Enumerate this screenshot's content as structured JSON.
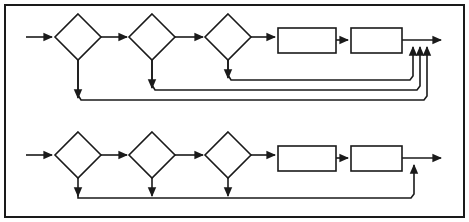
{
  "figure": {
    "type": "flowchart-diagram",
    "title": "",
    "width": 469,
    "height": 222,
    "background_color": "#ffffff",
    "stroke_color": "#1a1a1a",
    "fill_color": "#ffffff",
    "stroke_width": 1.6,
    "border": {
      "present": true,
      "x": 5,
      "y": 5,
      "width": 459,
      "height": 212,
      "stroke_width": 2
    }
  },
  "rows": [
    {
      "id": "top-row",
      "label": "",
      "baseline_y": 37,
      "input_arrow": {
        "x1": 26,
        "y1": 37,
        "x2": 54,
        "y2": 37
      },
      "diamonds": [
        {
          "id": "top-decision-1",
          "label": "",
          "cx": 78,
          "cy": 37,
          "rx": 23,
          "ry": 23
        },
        {
          "id": "top-decision-2",
          "label": "",
          "cx": 152,
          "cy": 37,
          "rx": 23,
          "ry": 23
        },
        {
          "id": "top-decision-3",
          "label": "",
          "cx": 228,
          "cy": 37,
          "rx": 23,
          "ry": 23
        }
      ],
      "rectangles": [
        {
          "id": "top-process-1",
          "label": "",
          "x": 278,
          "y": 28,
          "width": 58,
          "height": 25
        },
        {
          "id": "top-process-2",
          "label": "",
          "x": 351,
          "y": 28,
          "width": 51,
          "height": 25
        }
      ],
      "connectors": [
        {
          "id": "top-conn-d1-d2",
          "x1": 101,
          "y1": 37,
          "x2": 128,
          "y2": 37
        },
        {
          "id": "top-conn-d2-d3",
          "x1": 175,
          "y1": 37,
          "x2": 204,
          "y2": 37
        },
        {
          "id": "top-conn-d3-r1",
          "x1": 251,
          "y1": 37,
          "x2": 276,
          "y2": 37
        },
        {
          "id": "top-conn-r1-r2",
          "x1": 336,
          "y1": 40,
          "x2": 349,
          "y2": 40
        }
      ],
      "output_line": {
        "x1": 402,
        "y1": 40,
        "x2": 442,
        "y2": 40
      },
      "merge_arrows_up": [
        {
          "id": "top-merge-1",
          "x": 413,
          "y_from": 80,
          "y_to": 43
        },
        {
          "id": "top-merge-2",
          "x": 420,
          "y_from": 90,
          "y_to": 43
        },
        {
          "id": "top-merge-3",
          "x": 427,
          "y_from": 100,
          "y_to": 43
        }
      ],
      "return_paths": [
        {
          "id": "top-return-from-d3",
          "from": "top-decision-3",
          "drop_x": 228,
          "drop_y_start": 60,
          "drop_y_end": 77,
          "run_y": 80,
          "run_x_end": 413
        },
        {
          "id": "top-return-from-d2",
          "from": "top-decision-2",
          "drop_x": 152,
          "drop_y_start": 60,
          "drop_y_end": 87,
          "run_y": 90,
          "run_x_end": 420
        },
        {
          "id": "top-return-from-d1",
          "from": "top-decision-1",
          "drop_x": 78,
          "drop_y_start": 60,
          "drop_y_end": 97,
          "run_y": 100,
          "run_x_end": 427
        }
      ]
    },
    {
      "id": "bottom-row",
      "label": "",
      "baseline_y": 155,
      "input_arrow": {
        "x1": 26,
        "y1": 155,
        "x2": 54,
        "y2": 155
      },
      "diamonds": [
        {
          "id": "bottom-decision-1",
          "label": "",
          "cx": 78,
          "cy": 155,
          "rx": 23,
          "ry": 23
        },
        {
          "id": "bottom-decision-2",
          "label": "",
          "cx": 152,
          "cy": 155,
          "rx": 23,
          "ry": 23
        },
        {
          "id": "bottom-decision-3",
          "label": "",
          "cx": 228,
          "cy": 155,
          "rx": 23,
          "ry": 23
        }
      ],
      "rectangles": [
        {
          "id": "bottom-process-1",
          "label": "",
          "x": 278,
          "y": 146,
          "width": 58,
          "height": 25
        },
        {
          "id": "bottom-process-2",
          "label": "",
          "x": 351,
          "y": 146,
          "width": 51,
          "height": 25
        }
      ],
      "connectors": [
        {
          "id": "bottom-conn-d1-d2",
          "x1": 101,
          "y1": 155,
          "x2": 128,
          "y2": 155
        },
        {
          "id": "bottom-conn-d2-d3",
          "x1": 175,
          "y1": 155,
          "x2": 204,
          "y2": 155
        },
        {
          "id": "bottom-conn-d3-r1",
          "x1": 251,
          "y1": 155,
          "x2": 276,
          "y2": 155
        },
        {
          "id": "bottom-conn-r1-r2",
          "x1": 336,
          "y1": 158,
          "x2": 349,
          "y2": 158
        }
      ],
      "output_line": {
        "x1": 402,
        "y1": 158,
        "x2": 442,
        "y2": 158
      },
      "merge_arrows_up": [
        {
          "id": "bottom-merge-1",
          "x": 414,
          "y_from": 198,
          "y_to": 161
        }
      ],
      "shared_return": {
        "id": "bottom-shared-return",
        "run_y": 198,
        "run_x_start": 78,
        "run_x_end": 414,
        "drop_arrows": [
          {
            "id": "bottom-drop-d1",
            "x": 78,
            "y_start": 178,
            "y_end": 195
          },
          {
            "id": "bottom-drop-d2",
            "x": 152,
            "y_start": 178,
            "y_end": 195
          },
          {
            "id": "bottom-drop-d3",
            "x": 228,
            "y_start": 178,
            "y_end": 195
          }
        ]
      }
    }
  ],
  "legend": {
    "present": false,
    "items": []
  },
  "annotations": []
}
